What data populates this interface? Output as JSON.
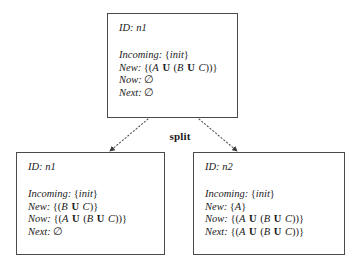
{
  "diagram": {
    "edge_label": "split",
    "background_color": "#ffffff",
    "box_border_color": "#4a4a4a",
    "edge_color": "#555555",
    "nodes": [
      {
        "key": "top",
        "id_label": "ID:",
        "id_value": "n1",
        "fields": [
          {
            "label": "Incoming:",
            "value": "{init}"
          },
          {
            "label": "New:",
            "value": "{(A U (B U C))}"
          },
          {
            "label": "Now:",
            "value": "∅"
          },
          {
            "label": "Next:",
            "value": "∅"
          }
        ]
      },
      {
        "key": "left",
        "id_label": "ID:",
        "id_value": "n1",
        "fields": [
          {
            "label": "Incoming:",
            "value": "{init}"
          },
          {
            "label": "New:",
            "value": "{(B U C)}"
          },
          {
            "label": "Now:",
            "value": "{(A U (B U C))}"
          },
          {
            "label": "Next:",
            "value": "∅"
          }
        ]
      },
      {
        "key": "right",
        "id_label": "ID:",
        "id_value": "n2",
        "fields": [
          {
            "label": "Incoming:",
            "value": "{init}"
          },
          {
            "label": "New:",
            "value": "{A}"
          },
          {
            "label": "Now:",
            "value": "{(A U (B U C))}"
          },
          {
            "label": "Next:",
            "value": "{(A U (B U C))}"
          }
        ]
      }
    ],
    "edges": [
      {
        "key": "edge-left",
        "from": "top",
        "to": "left",
        "style": "dotted",
        "arrowhead": true
      },
      {
        "key": "edge-right",
        "from": "top",
        "to": "right",
        "style": "dotted",
        "arrowhead": true
      }
    ]
  }
}
